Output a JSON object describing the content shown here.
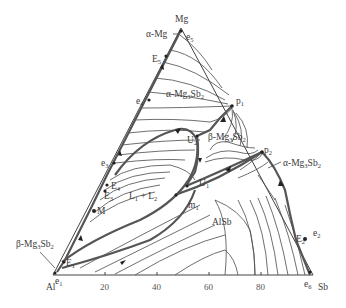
{
  "diagram": {
    "type": "ternary-phase-diagram",
    "components": {
      "top": "Mg",
      "left": "Al",
      "right": "Sb"
    },
    "bottom_axis_ticks": [
      "20",
      "40",
      "60",
      "80"
    ],
    "phase_fields": [
      {
        "label": "α-Mg"
      },
      {
        "label": "α-Mg3Sb2",
        "base": "α-Mg",
        "sub1": "3",
        "mid": "Sb",
        "sub2": "2"
      },
      {
        "label": "β-Mg3Sb2",
        "base": "β-Mg",
        "sub1": "3",
        "mid": "Sb",
        "sub2": "2"
      },
      {
        "label": "L1 + L2",
        "base": "L",
        "sub1": "1",
        "mid": " + L",
        "sub2": "2"
      },
      {
        "label": "AlSb"
      }
    ],
    "labels": {
      "alpha_mg": "α-Mg",
      "alpha_mg3sb2_top": {
        "a": "α-Mg",
        "s1": "3",
        "b": "Sb",
        "s2": "2"
      },
      "beta_mg3sb2_center": {
        "a": "β-Mg",
        "s1": "3",
        "b": "Sb",
        "s2": "2"
      },
      "alpha_mg3sb2_right": {
        "a": "α-Mg",
        "s1": "3",
        "b": "Sb",
        "s2": "2"
      },
      "beta_mg3sb2_left": {
        "a": "β-Mg",
        "s1": "3",
        "b": "Sb",
        "s2": "2"
      },
      "l1_l2": {
        "a": "L",
        "s1": "1",
        "b": " + L",
        "s2": "2"
      },
      "alsb": "AlSb"
    },
    "invariant_points": [
      {
        "name": "e1",
        "base": "e",
        "sub": "1"
      },
      {
        "name": "e2",
        "base": "e",
        "sub": "2"
      },
      {
        "name": "e3",
        "base": "e",
        "sub": "3"
      },
      {
        "name": "e4",
        "base": "e",
        "sub": "4"
      },
      {
        "name": "e5",
        "base": "e",
        "sub": "5"
      },
      {
        "name": "e6",
        "base": "e",
        "sub": "6"
      },
      {
        "name": "E1",
        "base": "E",
        "sub": "1"
      },
      {
        "name": "E2",
        "base": "E",
        "sub": "2"
      },
      {
        "name": "E3",
        "base": "E",
        "sub": "3"
      },
      {
        "name": "E4",
        "base": "E",
        "sub": "4"
      },
      {
        "name": "E5",
        "base": "E",
        "sub": "5"
      },
      {
        "name": "U1",
        "base": "U",
        "sub": "1"
      },
      {
        "name": "U2",
        "base": "U",
        "sub": "2"
      },
      {
        "name": "p1",
        "base": "p",
        "sub": "1"
      },
      {
        "name": "p2",
        "base": "p",
        "sub": "2"
      },
      {
        "name": "m1",
        "base": "m",
        "sub": "1"
      },
      {
        "name": "M",
        "base": "M",
        "sub": ""
      }
    ],
    "colors": {
      "lines": "#4a4a4a",
      "text": "#3a3a3a",
      "background": "#ffffff"
    }
  }
}
